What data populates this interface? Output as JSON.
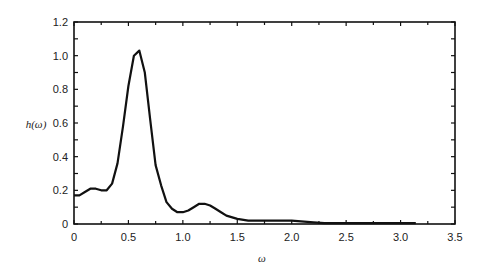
{
  "chart_data": {
    "type": "line",
    "title": "",
    "xlabel": "ω",
    "ylabel": "h(ω)",
    "xlim": [
      0,
      3.5
    ],
    "ylim": [
      0,
      1.2
    ],
    "xticks": [
      "0",
      "0.5",
      "1.0",
      "1.5",
      "2.0",
      "2.5",
      "3.0",
      "3.5"
    ],
    "yticks": [
      "0",
      "0.2",
      "0.4",
      "0.6",
      "0.8",
      "1.0",
      "1.2"
    ],
    "grid": false,
    "series": [
      {
        "name": "h(ω)",
        "color": "#111111",
        "x": [
          0,
          0.05,
          0.1,
          0.15,
          0.2,
          0.25,
          0.3,
          0.35,
          0.4,
          0.45,
          0.5,
          0.55,
          0.6,
          0.65,
          0.7,
          0.75,
          0.8,
          0.85,
          0.9,
          0.95,
          1.0,
          1.05,
          1.1,
          1.15,
          1.2,
          1.25,
          1.3,
          1.35,
          1.4,
          1.5,
          1.6,
          1.7,
          1.8,
          2.0,
          2.2,
          2.3,
          2.4,
          2.6,
          2.8,
          3.0,
          3.14
        ],
        "values": [
          0.17,
          0.17,
          0.19,
          0.21,
          0.21,
          0.2,
          0.2,
          0.24,
          0.36,
          0.58,
          0.82,
          1.0,
          1.03,
          0.9,
          0.62,
          0.35,
          0.23,
          0.13,
          0.09,
          0.07,
          0.07,
          0.08,
          0.1,
          0.12,
          0.12,
          0.11,
          0.09,
          0.07,
          0.05,
          0.03,
          0.02,
          0.02,
          0.02,
          0.02,
          0.01,
          0.005,
          0.005,
          0.005,
          0.005,
          0.005,
          0.005
        ]
      }
    ]
  }
}
